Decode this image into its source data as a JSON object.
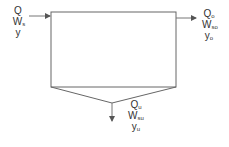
{
  "diagram": {
    "type": "settling-tank-mass-balance",
    "inlet": {
      "labels": [
        {
          "main": "Q",
          "sub": ""
        },
        {
          "main": "W",
          "sub": "s"
        },
        {
          "main": "y",
          "sub": ""
        }
      ]
    },
    "overflow": {
      "labels": [
        {
          "main": "Q",
          "sub": "o"
        },
        {
          "main": "W",
          "sub": "so"
        },
        {
          "main": "y",
          "sub": "o"
        }
      ]
    },
    "underflow": {
      "labels": [
        {
          "main": "Q",
          "sub": "u"
        },
        {
          "main": "W",
          "sub": "su"
        },
        {
          "main": "y",
          "sub": "u"
        }
      ]
    },
    "colors": {
      "stroke": "#555555",
      "text": "#333333"
    }
  }
}
